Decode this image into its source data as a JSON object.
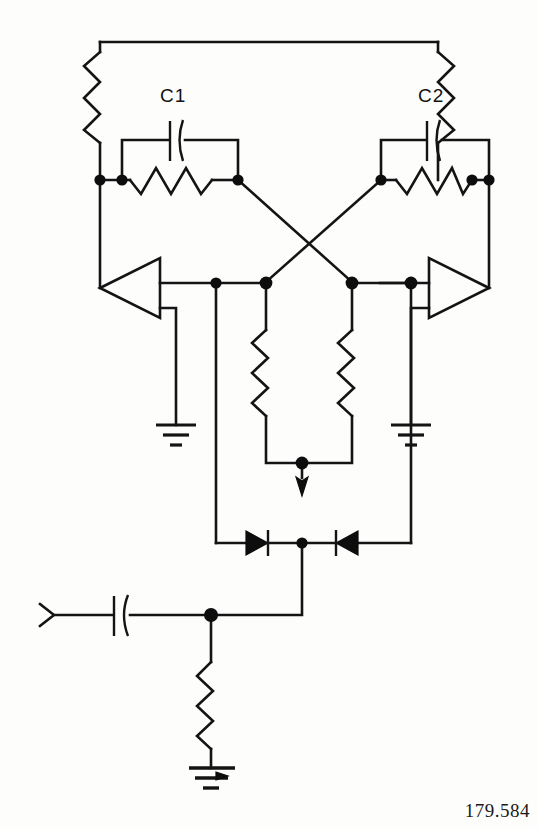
{
  "figure": {
    "number": "179.584",
    "type": "schematic-diagram",
    "background_color": "#fdfdfc",
    "line_color": "#141414"
  },
  "labels": {
    "c1": "C1",
    "c2": "C2"
  },
  "components": [
    {
      "id": "R-left-vertical",
      "name": "left-vertical-resistor",
      "type": "resistor"
    },
    {
      "id": "R-right-vertical",
      "name": "right-vertical-resistor",
      "type": "resistor"
    },
    {
      "id": "R-left-feedback",
      "name": "left-feedback-resistor",
      "type": "resistor"
    },
    {
      "id": "R-right-feedback",
      "name": "right-feedback-resistor",
      "type": "resistor"
    },
    {
      "id": "R-center-left",
      "name": "center-left-resistor",
      "type": "resistor"
    },
    {
      "id": "R-center-right",
      "name": "center-right-resistor",
      "type": "resistor"
    },
    {
      "id": "R-bias-bottom",
      "name": "bottom-bias-resistor",
      "type": "resistor"
    },
    {
      "id": "C1",
      "name": "capacitor-c1",
      "type": "capacitor",
      "label": "C1"
    },
    {
      "id": "C2",
      "name": "capacitor-c2",
      "type": "capacitor",
      "label": "C2"
    },
    {
      "id": "C-input",
      "name": "input-coupling-capacitor",
      "type": "capacitor"
    },
    {
      "id": "A-left",
      "name": "left-amplifier",
      "type": "amplifier",
      "orientation": "points-left"
    },
    {
      "id": "A-right",
      "name": "right-amplifier",
      "type": "amplifier",
      "orientation": "points-right"
    },
    {
      "id": "D-left",
      "name": "left-diode",
      "type": "diode",
      "orientation": "points-right"
    },
    {
      "id": "D-right",
      "name": "right-diode",
      "type": "diode",
      "orientation": "points-left"
    },
    {
      "id": "GND-left",
      "name": "left-ground",
      "type": "ground"
    },
    {
      "id": "GND-right",
      "name": "right-ground",
      "type": "ground"
    },
    {
      "id": "GND-bottom",
      "name": "bottom-ground",
      "type": "ground"
    },
    {
      "id": "ANT",
      "name": "antenna",
      "type": "antenna"
    },
    {
      "id": "ARROW-center",
      "name": "current-arrow",
      "type": "arrow",
      "direction": "down"
    }
  ]
}
